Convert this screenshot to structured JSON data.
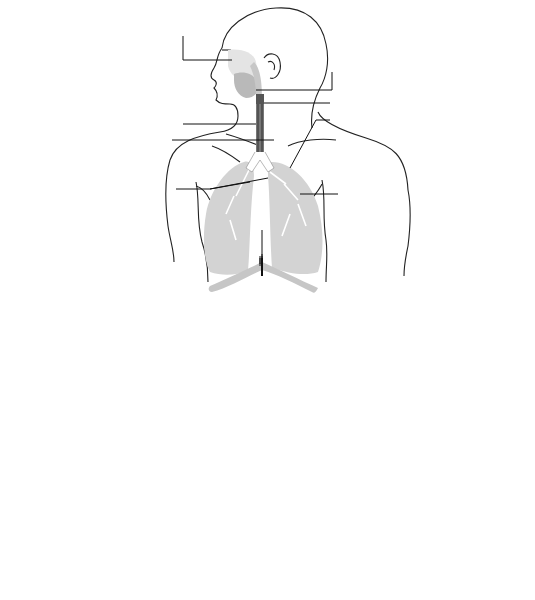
{
  "figure": {
    "panels": [
      {
        "id": "A",
        "caption": "(A)",
        "labels": {
          "nasal_cavity": "Nasal cavity",
          "pharynx": "Pharynx",
          "larynx": "Larynx",
          "trachea": "Trachea",
          "bronchioles": "Bronchioles",
          "lungs": "Lungs",
          "bronchi": "Bronchi",
          "alveoli": "Alveoli",
          "diaphragm": "Diaphragm"
        }
      },
      {
        "id": "B",
        "caption": "(B)",
        "labels": {
          "bronchiole": "Bronchiole",
          "respiratory_bronchiole_1": "Respiratory",
          "respiratory_bronchiole_2": "bronchiole",
          "alveoli_1": "Alveoli",
          "alveoli_2": "(air sacs)"
        }
      },
      {
        "id": "C",
        "caption": "(C)",
        "labels": {
          "smooth_muscle": "Smooth muscle",
          "elastin_fibres": "Elastin fibres",
          "capillaries": "Capillaries",
          "alveoli": "Alveoli"
        }
      }
    ]
  },
  "colors": {
    "line": "#1a1a1a",
    "lung_fill": "#d6d6d6",
    "sphere_light": "#f2f2f2",
    "sphere_dark": "#9a9a9a"
  }
}
